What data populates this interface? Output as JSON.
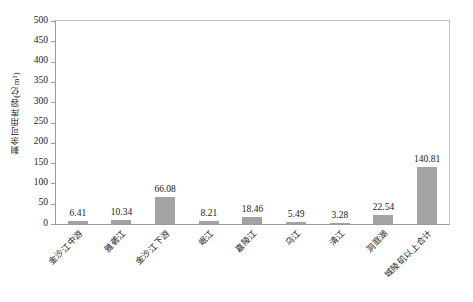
{
  "chart_data": {
    "type": "bar",
    "title": "",
    "xlabel": "",
    "ylabel": "剩余可用库容(亿m³)",
    "ylim": [
      0,
      500
    ],
    "ytick_step": 50,
    "yticks": [
      "500",
      "450",
      "400",
      "350",
      "300",
      "250",
      "200",
      "150",
      "100",
      "50",
      "0"
    ],
    "grid": false,
    "legend": null,
    "bar_color": "#a3a3a3",
    "categories": [
      "金沙江中游",
      "雅砻江",
      "金沙江下游",
      "岷江",
      "嘉陵江",
      "乌江",
      "清江",
      "洞庭湖",
      "城陵矶以上合计"
    ],
    "values": [
      6.41,
      10.34,
      66.08,
      8.21,
      18.46,
      5.49,
      3.28,
      22.54,
      140.81
    ],
    "value_labels": [
      "6.41",
      "10.34",
      "66.08",
      "8.21",
      "18.46",
      "5.49",
      "3.28",
      "22.54",
      "140.81"
    ]
  }
}
